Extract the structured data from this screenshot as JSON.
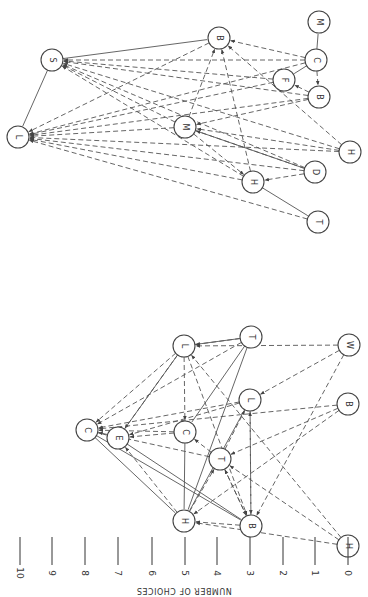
{
  "figure": {
    "colors": {
      "line": "#555555",
      "node_stroke": "#444444",
      "background": "#ffffff",
      "text": "#333333"
    },
    "node_radius": 11
  },
  "scale": {
    "title": "NUMBER OF CHOICES",
    "ticks": [
      {
        "label": "10",
        "x": 20
      },
      {
        "label": "9",
        "x": 52
      },
      {
        "label": "8",
        "x": 85
      },
      {
        "label": "7",
        "x": 118
      },
      {
        "label": "6",
        "x": 152
      },
      {
        "label": "5",
        "x": 185
      },
      {
        "label": "4",
        "x": 217
      },
      {
        "label": "3",
        "x": 250
      },
      {
        "label": "2",
        "x": 283
      },
      {
        "label": "1",
        "x": 315
      },
      {
        "label": "0",
        "x": 348
      }
    ]
  },
  "sociogram_upper": {
    "nodes": [
      {
        "id": "u_L",
        "label": "L",
        "x": 18,
        "y": 137
      },
      {
        "id": "u_S",
        "label": "S",
        "x": 52,
        "y": 60
      },
      {
        "id": "u_M1",
        "label": "M",
        "x": 185,
        "y": 127
      },
      {
        "id": "u_B1",
        "label": "B",
        "x": 219,
        "y": 38
      },
      {
        "id": "u_F",
        "label": "F",
        "x": 284,
        "y": 80
      },
      {
        "id": "u_C",
        "label": "C",
        "x": 316,
        "y": 60
      },
      {
        "id": "u_M2",
        "label": "M",
        "x": 319,
        "y": 22
      },
      {
        "id": "u_B2",
        "label": "B",
        "x": 319,
        "y": 97
      },
      {
        "id": "u_H1",
        "label": "H",
        "x": 350,
        "y": 152
      },
      {
        "id": "u_D",
        "label": "D",
        "x": 315,
        "y": 172
      },
      {
        "id": "u_H2",
        "label": "H",
        "x": 253,
        "y": 182
      },
      {
        "id": "u_T",
        "label": "T",
        "x": 318,
        "y": 222
      }
    ],
    "edges": [
      {
        "from": "u_S",
        "to": "u_L",
        "type": "solid"
      },
      {
        "from": "u_S",
        "to": "u_B1",
        "type": "solid"
      },
      {
        "from": "u_C",
        "to": "u_M2",
        "type": "solid"
      },
      {
        "from": "u_C",
        "to": "u_F",
        "type": "solid"
      },
      {
        "from": "u_H2",
        "to": "u_T",
        "type": "solid"
      },
      {
        "from": "u_M1",
        "to": "u_D",
        "type": "solid"
      },
      {
        "from": "u_C",
        "to": "u_B2",
        "type": "dashed"
      },
      {
        "from": "u_B2",
        "to": "u_F",
        "type": "dashed"
      },
      {
        "from": "u_C",
        "to": "u_B1",
        "type": "dashed"
      },
      {
        "from": "u_C",
        "to": "u_S",
        "type": "dashed"
      },
      {
        "from": "u_C",
        "to": "u_L",
        "type": "dashed"
      },
      {
        "from": "u_F",
        "to": "u_S",
        "type": "dashed"
      },
      {
        "from": "u_F",
        "to": "u_L",
        "type": "dashed"
      },
      {
        "from": "u_B2",
        "to": "u_S",
        "type": "dashed"
      },
      {
        "from": "u_B2",
        "to": "u_L",
        "type": "dashed"
      },
      {
        "from": "u_B2",
        "to": "u_M1",
        "type": "dashed"
      },
      {
        "from": "u_M1",
        "to": "u_B1",
        "type": "dashed"
      },
      {
        "from": "u_M1",
        "to": "u_S",
        "type": "dashed"
      },
      {
        "from": "u_M1",
        "to": "u_L",
        "type": "dashed"
      },
      {
        "from": "u_M1",
        "to": "u_H2",
        "type": "dashed"
      },
      {
        "from": "u_B1",
        "to": "u_L",
        "type": "dashed"
      },
      {
        "from": "u_H1",
        "to": "u_B1",
        "type": "dashed"
      },
      {
        "from": "u_H1",
        "to": "u_M1",
        "type": "dashed"
      },
      {
        "from": "u_H1",
        "to": "u_S",
        "type": "dashed"
      },
      {
        "from": "u_H1",
        "to": "u_L",
        "type": "dashed"
      },
      {
        "from": "u_D",
        "to": "u_M1",
        "type": "dashed"
      },
      {
        "from": "u_D",
        "to": "u_H2",
        "type": "dashed"
      },
      {
        "from": "u_D",
        "to": "u_L",
        "type": "dashed"
      },
      {
        "from": "u_D",
        "to": "u_S",
        "type": "dashed"
      },
      {
        "from": "u_H2",
        "to": "u_L",
        "type": "dashed"
      },
      {
        "from": "u_H2",
        "to": "u_B1",
        "type": "dashed"
      },
      {
        "from": "u_T",
        "to": "u_L",
        "type": "dashed"
      },
      {
        "from": "u_H2",
        "to": "u_S",
        "type": "dashed"
      }
    ]
  },
  "sociogram_lower": {
    "nodes": [
      {
        "id": "l_C1",
        "label": "C",
        "x": 87,
        "y": 430
      },
      {
        "id": "l_E",
        "label": "E",
        "x": 118,
        "y": 438
      },
      {
        "id": "l_L1",
        "label": "L",
        "x": 184,
        "y": 346
      },
      {
        "id": "l_T1",
        "label": "T",
        "x": 251,
        "y": 337
      },
      {
        "id": "l_C2",
        "label": "C",
        "x": 185,
        "y": 432
      },
      {
        "id": "l_L2",
        "label": "L",
        "x": 250,
        "y": 400
      },
      {
        "id": "l_T2",
        "label": "T",
        "x": 220,
        "y": 459
      },
      {
        "id": "l_W",
        "label": "W",
        "x": 349,
        "y": 345
      },
      {
        "id": "l_B1",
        "label": "B",
        "x": 348,
        "y": 404
      },
      {
        "id": "l_H1",
        "label": "H",
        "x": 184,
        "y": 521
      },
      {
        "id": "l_B2",
        "label": "B",
        "x": 251,
        "y": 526
      },
      {
        "id": "l_H2",
        "label": "H",
        "x": 348,
        "y": 546
      }
    ],
    "edges": [
      {
        "from": "l_C1",
        "to": "l_E",
        "type": "solid"
      },
      {
        "from": "l_C1",
        "to": "l_H1",
        "type": "solid"
      },
      {
        "from": "l_C1",
        "to": "l_B2",
        "type": "solid"
      },
      {
        "from": "l_E",
        "to": "l_L1",
        "type": "solid"
      },
      {
        "from": "l_E",
        "to": "l_B2",
        "type": "solid"
      },
      {
        "from": "l_L1",
        "to": "l_T1",
        "type": "solid"
      },
      {
        "from": "l_T1",
        "to": "l_C2",
        "type": "solid"
      },
      {
        "from": "l_T1",
        "to": "l_H1",
        "type": "solid"
      },
      {
        "from": "l_C2",
        "to": "l_H1",
        "type": "solid"
      },
      {
        "from": "l_L2",
        "to": "l_H1",
        "type": "solid"
      },
      {
        "from": "l_L1",
        "to": "l_C1",
        "type": "dashed"
      },
      {
        "from": "l_L1",
        "to": "l_E",
        "type": "dashed"
      },
      {
        "from": "l_L1",
        "to": "l_C2",
        "type": "dashed"
      },
      {
        "from": "l_L1",
        "to": "l_B2",
        "type": "dashed"
      },
      {
        "from": "l_T1",
        "to": "l_C1",
        "type": "dashed"
      },
      {
        "from": "l_T1",
        "to": "l_L1",
        "type": "dashed"
      },
      {
        "from": "l_W",
        "to": "l_L1",
        "type": "dashed"
      },
      {
        "from": "l_W",
        "to": "l_L2",
        "type": "dashed"
      },
      {
        "from": "l_W",
        "to": "l_B2",
        "type": "dashed"
      },
      {
        "from": "l_B1",
        "to": "l_C1",
        "type": "dashed"
      },
      {
        "from": "l_B1",
        "to": "l_T2",
        "type": "dashed"
      },
      {
        "from": "l_B1",
        "to": "l_H1",
        "type": "dashed"
      },
      {
        "from": "l_L2",
        "to": "l_C1",
        "type": "dashed"
      },
      {
        "from": "l_L2",
        "to": "l_E",
        "type": "dashed"
      },
      {
        "from": "l_L2",
        "to": "l_B2",
        "type": "dashed"
      },
      {
        "from": "l_C2",
        "to": "l_C1",
        "type": "dashed"
      },
      {
        "from": "l_C2",
        "to": "l_E",
        "type": "dashed"
      },
      {
        "from": "l_T2",
        "to": "l_C2",
        "type": "dashed"
      },
      {
        "from": "l_T2",
        "to": "l_L2",
        "type": "dashed"
      },
      {
        "from": "l_T2",
        "to": "l_B2",
        "type": "dashed"
      },
      {
        "from": "l_T2",
        "to": "l_C1",
        "type": "dashed"
      },
      {
        "from": "l_H1",
        "to": "l_T2",
        "type": "dashed"
      },
      {
        "from": "l_H1",
        "to": "l_E",
        "type": "dashed"
      },
      {
        "from": "l_B2",
        "to": "l_H1",
        "type": "dashed"
      },
      {
        "from": "l_B2",
        "to": "l_T2",
        "type": "dashed"
      },
      {
        "from": "l_B2",
        "to": "l_L2",
        "type": "dashed"
      },
      {
        "from": "l_H2",
        "to": "l_T2",
        "type": "dashed"
      },
      {
        "from": "l_H2",
        "to": "l_L1",
        "type": "dashed"
      },
      {
        "from": "l_H2",
        "to": "l_H1",
        "type": "dashed"
      }
    ]
  }
}
